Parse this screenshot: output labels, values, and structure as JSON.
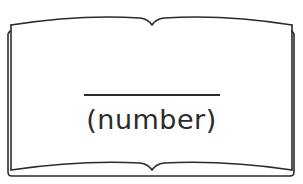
{
  "figure": {
    "type": "open-book-outline",
    "stroke_color": "#2b2b2b",
    "background": "#ffffff"
  },
  "book": {
    "blank_line": "",
    "label": "(number)"
  }
}
